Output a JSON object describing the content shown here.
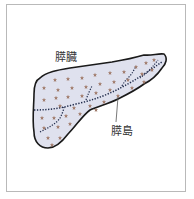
{
  "diagram": {
    "labels": {
      "organ": "膵臓",
      "islet": "膵島"
    },
    "colors": {
      "organ_fill": "#dfe1ee",
      "organ_outline": "#1a1a1a",
      "islet": "#a07a6a",
      "duct": "#1f2a4a",
      "frame": "#b9b9b9",
      "background": "#ffffff"
    },
    "icons": {
      "islet_marker": "flower-star-icon"
    }
  }
}
